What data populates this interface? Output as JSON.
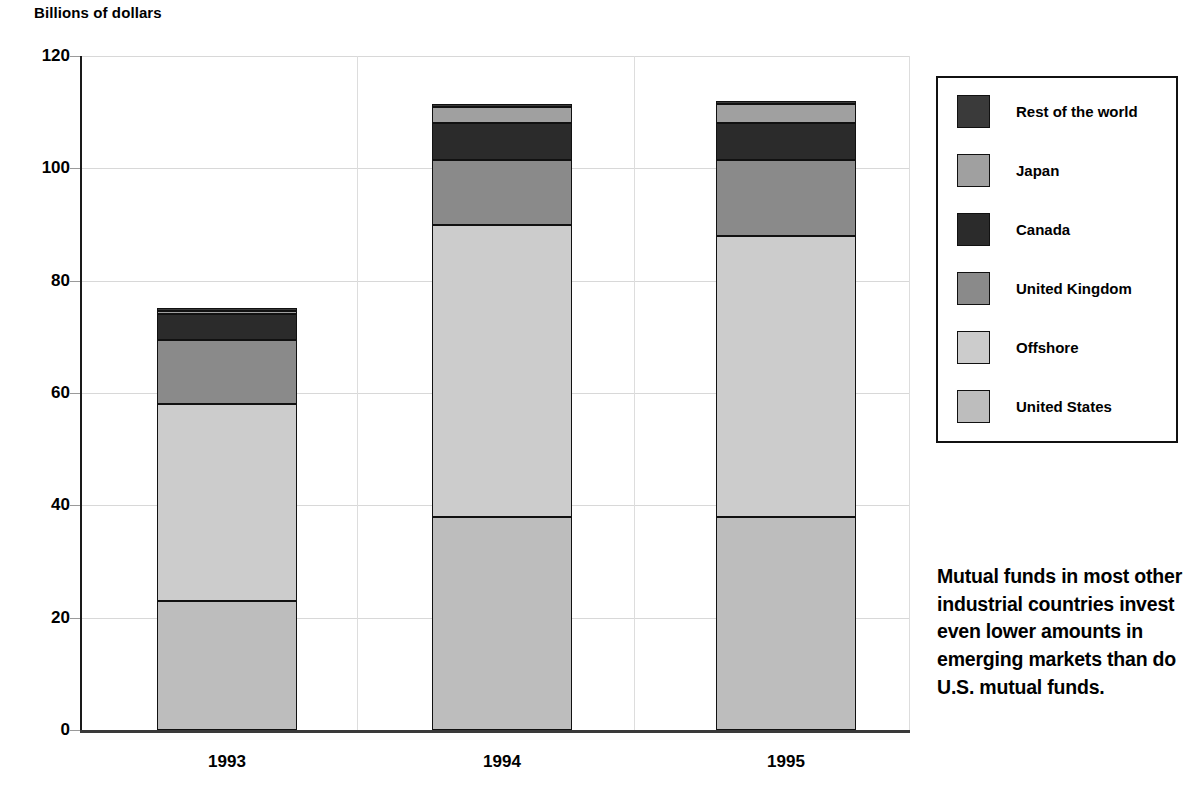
{
  "chart_data": {
    "type": "bar",
    "subtype": "stacked-bar",
    "title": "",
    "ylabel": "Billions of dollars",
    "xlabel": "",
    "ylim": [
      0,
      120
    ],
    "yticks": [
      0,
      20,
      40,
      60,
      80,
      100,
      120
    ],
    "grid": true,
    "legend_position": "right",
    "categories": [
      "1993",
      "1994",
      "1995"
    ],
    "series": [
      {
        "name": "United States",
        "color": "#bdbdbd",
        "values": [
          23.0,
          38.0,
          38.0
        ]
      },
      {
        "name": "Offshore",
        "color": "#cccccc",
        "values": [
          35.0,
          52.0,
          50.0
        ]
      },
      {
        "name": "United Kingdom",
        "color": "#8a8a8a",
        "values": [
          11.5,
          11.5,
          13.5
        ]
      },
      {
        "name": "Canada",
        "color": "#2b2b2b",
        "values": [
          4.5,
          6.5,
          6.5
        ]
      },
      {
        "name": "Japan",
        "color": "#a0a0a0",
        "values": [
          0.6,
          3.0,
          3.5
        ]
      },
      {
        "name": "Rest of the world",
        "color": "#3a3a3a",
        "values": [
          0.4,
          0.5,
          0.5
        ]
      }
    ],
    "totals": [
      75.0,
      111.5,
      112.0
    ],
    "cumulative_tops": {
      "1993": {
        "United States": 23.0,
        "Offshore": 58.0,
        "United Kingdom": 69.5,
        "Canada": 74.0,
        "Japan": 74.6,
        "Rest of the world": 75.0
      },
      "1994": {
        "United States": 38.0,
        "Offshore": 90.0,
        "United Kingdom": 101.5,
        "Canada": 108.0,
        "Japan": 111.0,
        "Rest of the world": 111.5
      },
      "1995": {
        "United States": 38.0,
        "Offshore": 88.0,
        "United Kingdom": 101.5,
        "Canada": 108.0,
        "Japan": 111.5,
        "Rest of the world": 112.0
      }
    }
  },
  "axis": {
    "y_title": "Billions of dollars",
    "y_ticks": [
      "120",
      "100",
      "80",
      "60",
      "40",
      "20",
      "0"
    ],
    "x_ticks": [
      "1993",
      "1994",
      "1995"
    ]
  },
  "legend": {
    "items": [
      {
        "label": "Rest of the world",
        "color": "#3a3a3a"
      },
      {
        "label": "Japan",
        "color": "#a0a0a0"
      },
      {
        "label": "Canada",
        "color": "#2b2b2b"
      },
      {
        "label": "United Kingdom",
        "color": "#8a8a8a"
      },
      {
        "label": "Offshore",
        "color": "#cccccc"
      },
      {
        "label": "United States",
        "color": "#bdbdbd"
      }
    ]
  },
  "annotation": {
    "text": "Mutual funds in most other industrial countries invest even lower amounts in emerging markets than do U.S. mutual funds."
  }
}
